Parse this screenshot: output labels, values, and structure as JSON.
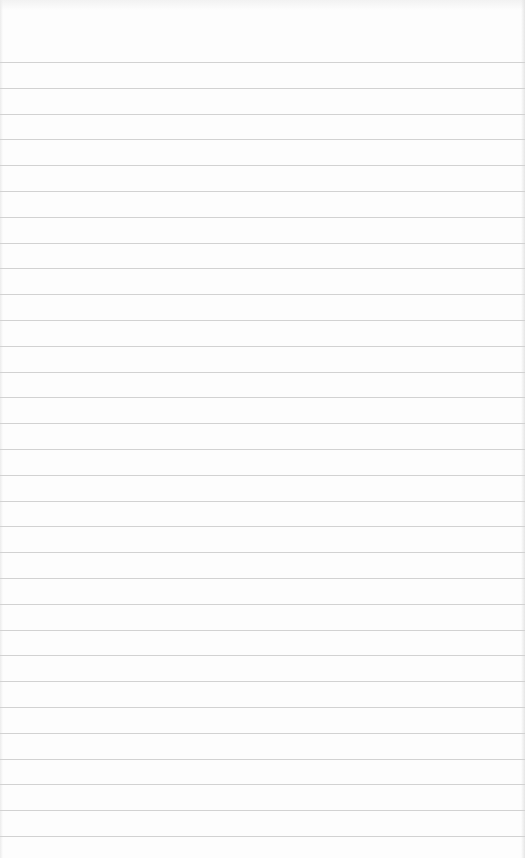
{
  "page": {
    "type": "ruled-paper",
    "background_color": "#fdfdfd",
    "line_color": "#d2d2d2",
    "first_line_y": 62,
    "line_spacing": 25.8,
    "line_count": 31
  }
}
